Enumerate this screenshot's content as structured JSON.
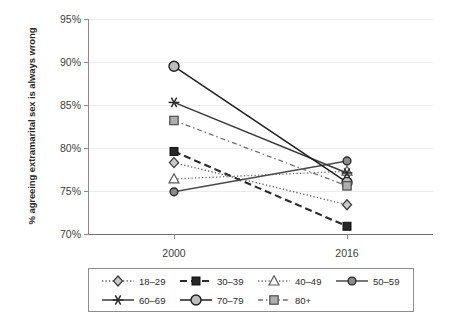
{
  "chart_data": {
    "type": "line",
    "title": "",
    "xlabel": "",
    "ylabel": "% agreeing extramarital sex is always wrong",
    "x": [
      "2000",
      "2016"
    ],
    "categories": [
      "2000",
      "2016"
    ],
    "ylim": [
      70,
      95
    ],
    "ytick_labels": [
      "70%",
      "75%",
      "80%",
      "85%",
      "90%",
      "95%"
    ],
    "ytick_values": [
      70,
      75,
      80,
      85,
      90,
      95
    ],
    "grid": true,
    "legend_position": "bottom",
    "series": [
      {
        "name": "18–29",
        "values": [
          78.3,
          73.4
        ],
        "marker": "diamond",
        "line": "dotted",
        "color": "#5a5a5a"
      },
      {
        "name": "30–39",
        "values": [
          79.6,
          70.9
        ],
        "marker": "square-filled",
        "line": "dashed",
        "color": "#2b2b2b"
      },
      {
        "name": "40–49",
        "values": [
          76.4,
          77.3
        ],
        "marker": "triangle",
        "line": "dotted",
        "color": "#6b6b6b"
      },
      {
        "name": "50–59",
        "values": [
          74.9,
          78.5
        ],
        "marker": "circle-small",
        "line": "solid",
        "color": "#4a4a4a"
      },
      {
        "name": "60–69",
        "values": [
          85.3,
          77.1
        ],
        "marker": "star",
        "line": "solid",
        "color": "#3a3a3a"
      },
      {
        "name": "70–79",
        "values": [
          89.5,
          76.0
        ],
        "marker": "circle-large",
        "line": "solid",
        "color": "#1f1f1f"
      },
      {
        "name": "80+",
        "values": [
          83.2,
          75.6
        ],
        "marker": "square-gray",
        "line": "dashdot",
        "color": "#707070"
      }
    ]
  },
  "axis": {
    "y_labels": [
      "95%",
      "90%",
      "85%",
      "80%",
      "75%",
      "70%"
    ],
    "x_labels": [
      "2000",
      "2016"
    ],
    "y_title": "% agreeing extramarital sex is always wrong"
  },
  "legend": {
    "row1": [
      "18–29",
      "30–39",
      "40–49",
      "50–59"
    ],
    "row2": [
      "60–69",
      "70–79",
      "80+"
    ]
  }
}
